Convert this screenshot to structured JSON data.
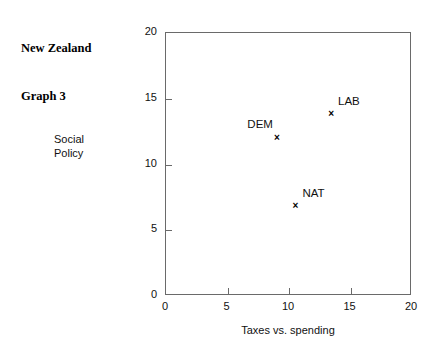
{
  "chart_data": {
    "type": "scatter",
    "title": "New Zealand Graph 3",
    "title_lines": [
      "New Zealand",
      "Graph 3"
    ],
    "xlabel": "Taxes vs. spending",
    "ylabel": "Social Policy",
    "ylabel_lines": [
      "Social",
      "Policy"
    ],
    "xlim": [
      0,
      20
    ],
    "ylim": [
      0,
      20
    ],
    "xticks": [
      0,
      5,
      10,
      15,
      20
    ],
    "yticks": [
      0,
      5,
      10,
      15,
      20
    ],
    "xtick_labels": [
      "0",
      "5",
      "10",
      "15",
      "20"
    ],
    "ytick_labels": [
      "0",
      "5",
      "10",
      "15",
      "20"
    ],
    "grid": false,
    "legend": "none",
    "marker": "x",
    "points": [
      {
        "label": "LAB",
        "x": 13.5,
        "y": 13.8,
        "label_pos": "upper-right"
      },
      {
        "label": "DEM",
        "x": 9.1,
        "y": 12.0,
        "label_pos": "upper-left"
      },
      {
        "label": "NAT",
        "x": 10.6,
        "y": 6.8,
        "label_pos": "upper-right"
      }
    ],
    "colors": {
      "background": "#ffffff",
      "axis": "#6a6a6a",
      "text": "#111111",
      "marker": "#000000"
    }
  }
}
